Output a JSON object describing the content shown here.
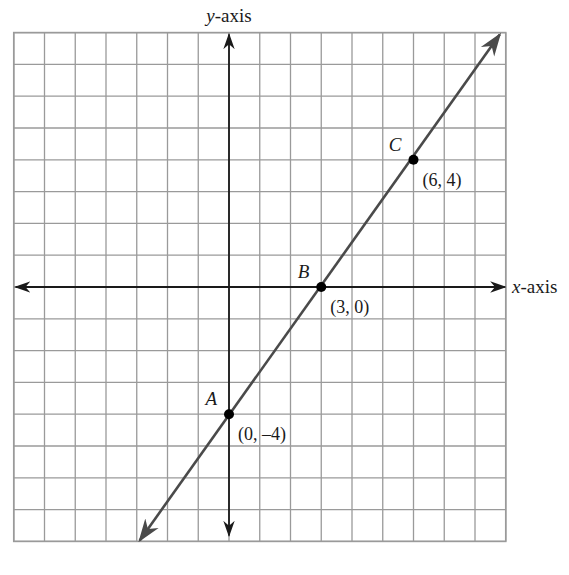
{
  "chart_data": {
    "type": "line",
    "title": "",
    "xlabel": "x-axis",
    "ylabel": "y-axis",
    "xlim": [
      -7,
      9
    ],
    "ylim": [
      -8,
      8
    ],
    "grid": true,
    "grid_step": 1,
    "series": [
      {
        "name": "line through A, B, C",
        "x": [
          -3,
          9
        ],
        "y": [
          -8,
          8
        ],
        "slope": 1.3333,
        "intercept": -4,
        "arrows": "both"
      }
    ],
    "points": [
      {
        "name": "A",
        "x": 0,
        "y": -4,
        "label": "(0, –4)"
      },
      {
        "name": "B",
        "x": 3,
        "y": 0,
        "label": "(3, 0)"
      },
      {
        "name": "C",
        "x": 6,
        "y": 4,
        "label": "(6, 4)"
      }
    ]
  },
  "axes": {
    "x_label_var": "x",
    "x_label_rest": "-axis",
    "y_label_var": "y",
    "y_label_rest": "-axis"
  },
  "colors": {
    "grid": "#9a9a9a",
    "axis": "#1a1a1a",
    "line": "#4a4a4a",
    "point": "#000000"
  }
}
